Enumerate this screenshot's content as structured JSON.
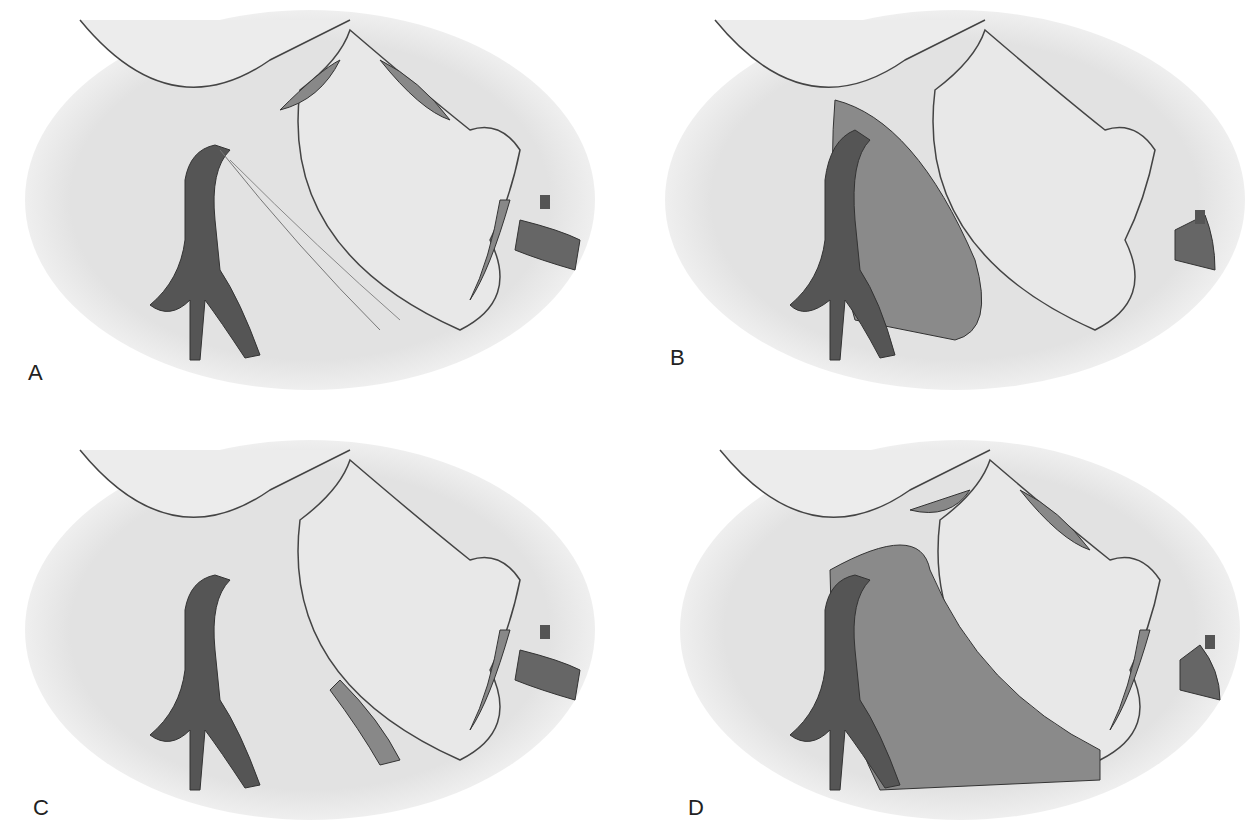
{
  "figure": {
    "panels": [
      {
        "id": "A",
        "label": "A",
        "left": 20,
        "top": 0,
        "label_x": 28,
        "label_y": 372
      },
      {
        "id": "B",
        "label": "B",
        "left": 655,
        "top": 0,
        "label_x": 670,
        "label_y": 357
      },
      {
        "id": "C",
        "label": "C",
        "left": 20,
        "top": 430,
        "label_x": 33,
        "label_y": 795
      },
      {
        "id": "D",
        "label": "D",
        "left": 680,
        "top": 430,
        "label_x": 688,
        "label_y": 795
      }
    ],
    "colors": {
      "background": "#ffffff",
      "tissue": "#e4e4e4",
      "outline": "#3a3a3a",
      "vessel": "#555555",
      "shaded_region": "#8a8a8a"
    }
  }
}
